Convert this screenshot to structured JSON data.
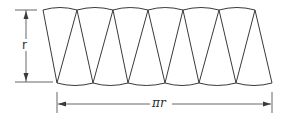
{
  "figure": {
    "sector_count": 13,
    "top_vertices_x": [
      43,
      77,
      113,
      148,
      183,
      219,
      255
    ],
    "bottom_vertices_x": [
      57,
      93,
      128,
      165,
      199,
      236,
      272
    ],
    "top_y": 10,
    "bottom_y": 83,
    "line_color": "#3a3a3a"
  },
  "labels": {
    "height": "r",
    "width": "πr"
  },
  "dimensions": {
    "height_dimension": {
      "x": 26,
      "y_top": 10,
      "y_bottom": 82
    },
    "width_dimension": {
      "y": 104,
      "x_left": 57,
      "x_right": 272
    }
  }
}
